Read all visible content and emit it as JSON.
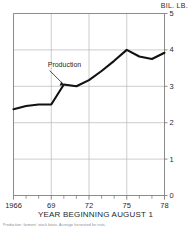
{
  "chart_data": {
    "type": "line",
    "title": "",
    "subtitle": "",
    "unit_label": "BIL. LB.",
    "xlabel": "YEAR BEGINNING AUGUST 1",
    "ylabel": "",
    "xlim": [
      1966,
      1978
    ],
    "ylim": [
      0,
      5
    ],
    "grid": true,
    "legend_position": "inline-annotation",
    "x_tick_labels": [
      "1966",
      "69",
      "72",
      "75",
      "78"
    ],
    "x_tick_values": [
      1966,
      1969,
      1972,
      1975,
      1978
    ],
    "x_minor_ticks": [
      1967,
      1968,
      1970,
      1971,
      1973,
      1974,
      1976,
      1977
    ],
    "y_tick_labels": [
      "0",
      "1",
      "2",
      "3",
      "4",
      "5"
    ],
    "y_tick_values": [
      0,
      1,
      2,
      3,
      4,
      5
    ],
    "y_axis_side": "right",
    "series": [
      {
        "name": "Production",
        "annotation": "Production",
        "color": "#111111",
        "x": [
          1966,
          1967,
          1968,
          1969,
          1970,
          1971,
          1972,
          1973,
          1974,
          1975,
          1976,
          1977,
          1978
        ],
        "values": [
          2.37,
          2.46,
          2.5,
          2.5,
          3.05,
          3.0,
          3.17,
          3.42,
          3.7,
          4.0,
          3.82,
          3.75,
          3.92
        ]
      }
    ],
    "footnote": "Production: farmers' stock basis. Acreage harvested for nuts."
  },
  "colors": {
    "line": "#111111",
    "grid": "#b8b8b8",
    "frame": "#6f6f6f",
    "text": "#1f1f1f",
    "footnote": "#8a8a8a"
  }
}
